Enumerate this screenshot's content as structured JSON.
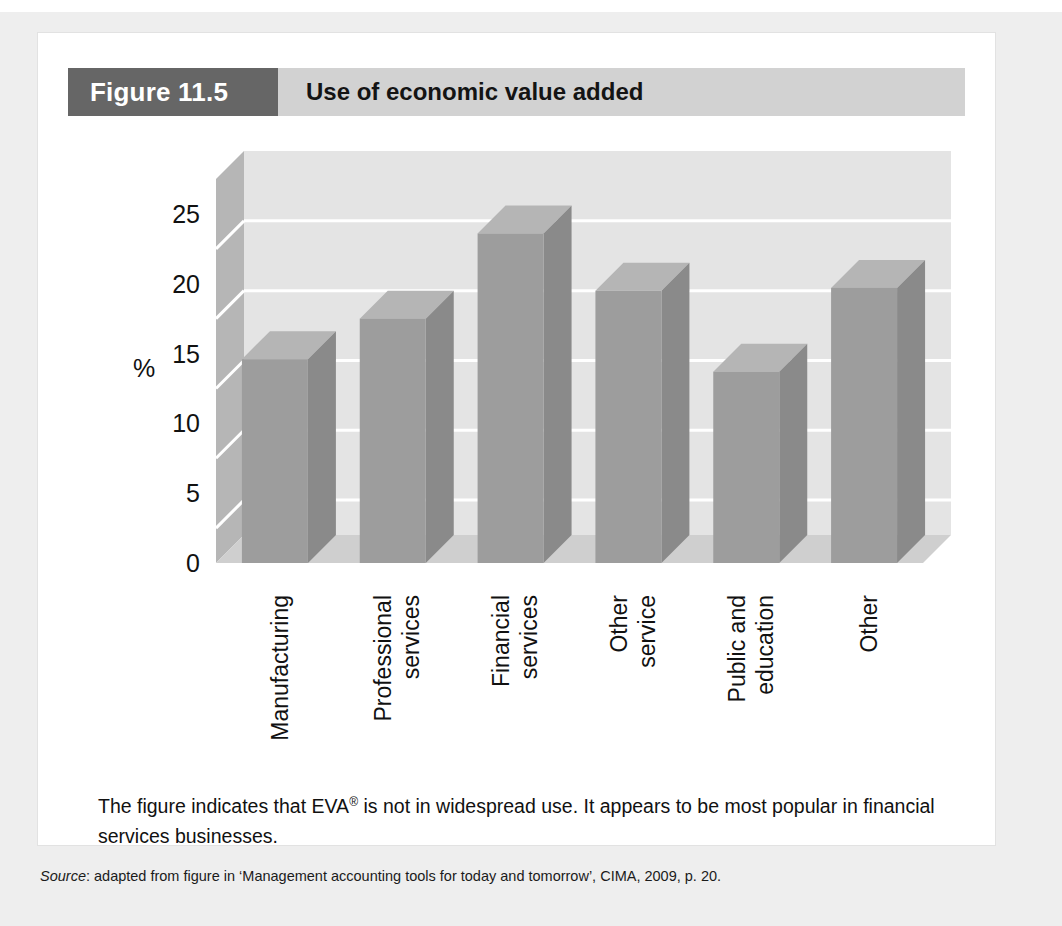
{
  "figure": {
    "tag": "Figure 11.5",
    "title": "Use of economic value added"
  },
  "caption": {
    "line1_before": "The figure indicates that EVA",
    "registered_mark": "®",
    "line1_after": " is not in widespread use. It appears to be most popular in financial services businesses."
  },
  "source": {
    "label": "Source",
    "text": ": adapted from figure in ‘Management accounting tools for today and tomorrow’, CIMA, 2009, p. 20."
  },
  "colors": {
    "header_tag_bg": "#666666",
    "header_bar_bg": "#d2d2d2",
    "bar_front": "#9d9d9d",
    "bar_side": "#8a8a8a",
    "bar_top": "#b5b5b5",
    "wall_back": "#e4e4e4",
    "wall_left": "#b6b6b6",
    "floor": "#cfcfcf",
    "gridline": "#ffffff",
    "card_bg": "#ffffff",
    "page_bg": "#eeeeee"
  },
  "chart_data": {
    "type": "bar",
    "title": "Use of economic value added",
    "xlabel": "",
    "ylabel": "%",
    "ylim": [
      0,
      27.5
    ],
    "yticks": [
      0,
      5,
      10,
      15,
      20,
      25
    ],
    "ytick_labels": [
      "0",
      "5",
      "10",
      "15",
      "20",
      "25"
    ],
    "gridlines": [
      2.5,
      7.5,
      12.5,
      17.5,
      22.5
    ],
    "grid": true,
    "legend": "none",
    "three_d": true,
    "categories": [
      "Manufacturing",
      "Professional services",
      "Financial services",
      "Other service",
      "Public and education",
      "Other"
    ],
    "category_lines": [
      [
        "Manufacturing"
      ],
      [
        "Professional",
        "services"
      ],
      [
        "Financial",
        "services"
      ],
      [
        "Other",
        "service"
      ],
      [
        "Public and",
        "education"
      ],
      [
        "Other"
      ]
    ],
    "values": [
      14.6,
      17.5,
      23.6,
      19.5,
      13.7,
      19.7
    ],
    "value_unit": "%"
  }
}
